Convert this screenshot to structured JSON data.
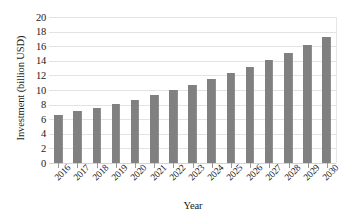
{
  "chart_data": {
    "type": "bar",
    "title": "",
    "xlabel": "Year",
    "ylabel": "Investment (billion USD)",
    "categories": [
      "2016",
      "2017",
      "2018",
      "2019",
      "2020",
      "2021",
      "2022",
      "2023",
      "2024",
      "2025",
      "2026",
      "2027",
      "2028",
      "2029",
      "2030"
    ],
    "values": [
      6.6,
      7.1,
      7.6,
      8.1,
      8.7,
      9.35,
      10.0,
      10.7,
      11.5,
      12.3,
      13.2,
      14.1,
      15.1,
      16.2,
      17.3
    ],
    "series": [
      {
        "name": "Investment",
        "values": [
          6.6,
          7.1,
          7.6,
          8.1,
          8.7,
          9.35,
          10.0,
          10.7,
          11.5,
          12.3,
          13.2,
          14.1,
          15.1,
          16.2,
          17.3
        ]
      }
    ],
    "ylim": [
      0,
      20
    ],
    "ytick_labels": [
      "0",
      "2",
      "4",
      "6",
      "8",
      "10",
      "12",
      "14",
      "16",
      "18",
      "20"
    ],
    "ytick_values": [
      0,
      2,
      4,
      6,
      8,
      10,
      12,
      14,
      16,
      18,
      20
    ],
    "grid": "horizontal",
    "legend": "none",
    "bar_color": "#808080",
    "gridline_color": "#e3e3e3",
    "background_color": "#ffffff",
    "xtick_label_rotation": -45
  }
}
